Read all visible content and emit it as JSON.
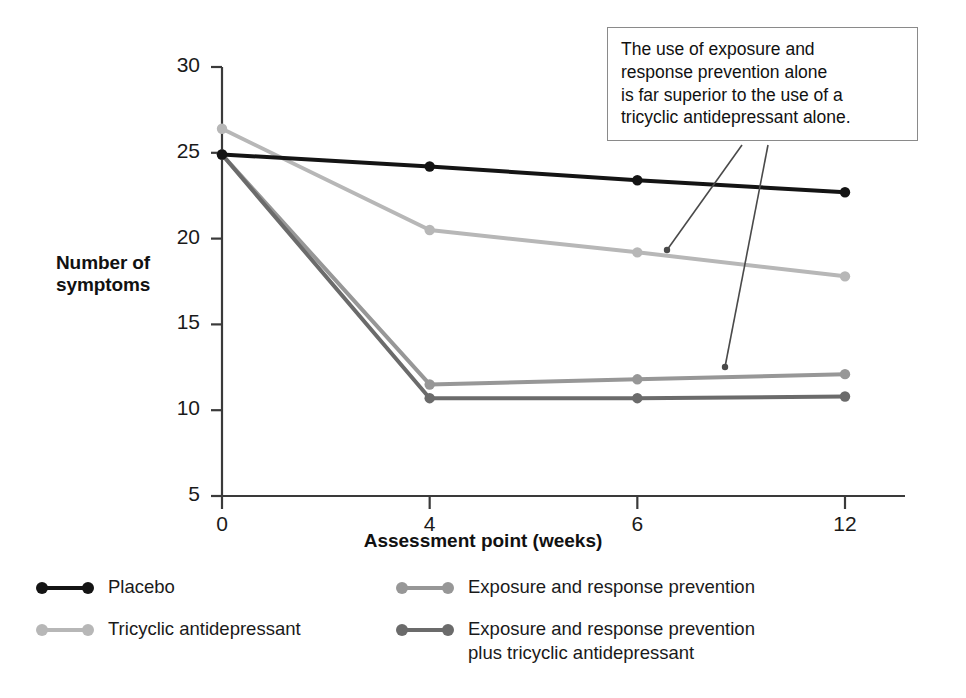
{
  "chart_data": {
    "type": "line",
    "title": "",
    "xlabel": "Assessment point (weeks)",
    "ylabel": "Number of symptoms",
    "categories": [
      "0",
      "4",
      "6",
      "12"
    ],
    "x": [
      0,
      4,
      6,
      12
    ],
    "ylim": [
      5,
      30
    ],
    "yticks": [
      "5",
      "10",
      "15",
      "20",
      "25",
      "30"
    ],
    "grid": false,
    "legend_position": "bottom",
    "series": [
      {
        "name": "Placebo",
        "color": "#141414",
        "values": [
          24.9,
          24.2,
          23.4,
          22.7
        ]
      },
      {
        "name": "Tricyclic antidepressant",
        "color": "#b7b7b7",
        "values": [
          26.4,
          20.5,
          19.2,
          17.8
        ]
      },
      {
        "name": "Exposure and response prevention",
        "color": "#979797",
        "values": [
          24.9,
          11.5,
          11.8,
          12.1
        ]
      },
      {
        "name": "Exposure and response prevention\nplus tricyclic antidepressant",
        "color": "#6b6b6b",
        "values": [
          24.9,
          10.7,
          10.7,
          10.8
        ]
      }
    ],
    "annotations": [
      {
        "text": "The use of exposure and response prevention alone is far superior to the use of a tricyclic antidepressant alone.",
        "lines": [
          "The use of exposure and",
          "response prevention alone",
          "is far superior to the use of a",
          "tricyclic antidepressant alone."
        ]
      }
    ]
  },
  "axis": {
    "y_label_line1": "Number of",
    "y_label_line2": "symptoms",
    "x_label": "Assessment point (weeks)"
  },
  "colors": {
    "placebo": "#141414",
    "tricyclic": "#b7b7b7",
    "erp": "#979797",
    "erp_plus_tricyclic": "#6b6b6b",
    "axis": "#3a3a3a",
    "callout_border": "#8a8a8a",
    "leader_line": "#4a4a4a"
  }
}
